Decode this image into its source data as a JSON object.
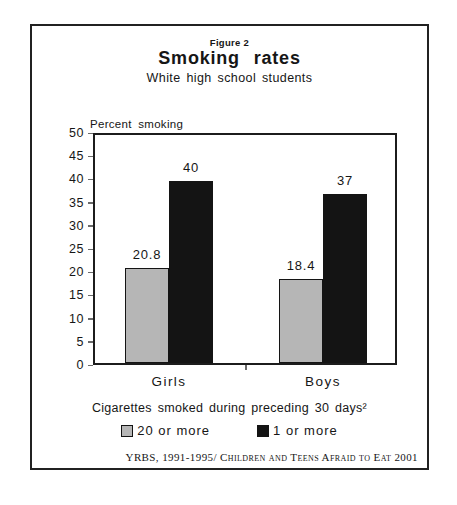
{
  "header": {
    "figure_label": "Figure 2",
    "title": "Smoking rates",
    "subtitle": "White high school students"
  },
  "chart_data": {
    "type": "bar",
    "title": "Smoking rates",
    "subtitle": "White high school students",
    "categories": [
      "Girls",
      "Boys"
    ],
    "series": [
      {
        "name": "20 or more",
        "values": [
          20.8,
          18.4
        ],
        "color": "#b6b6b6"
      },
      {
        "name": "1 or more",
        "values": [
          40,
          37
        ],
        "color": "#141414"
      }
    ],
    "bar_labels": [
      "20.8",
      "40",
      "18.4",
      "37"
    ],
    "xlabel": "",
    "ylabel": "Percent smoking",
    "ylim": [
      0,
      50
    ],
    "yticks": [
      0,
      5,
      10,
      15,
      20,
      25,
      30,
      35,
      40,
      45,
      50
    ],
    "grid": false,
    "legend_position": "bottom"
  },
  "legend": {
    "caption": "Cigarettes smoked during preceding 30 days²",
    "items": [
      {
        "label": "20 or more",
        "color": "#b6b6b6"
      },
      {
        "label": "1 or more",
        "color": "#141414"
      }
    ]
  },
  "footer": {
    "credit": "YRBS, 1991-1995/ Children and Teens Afraid to Eat 2001"
  }
}
